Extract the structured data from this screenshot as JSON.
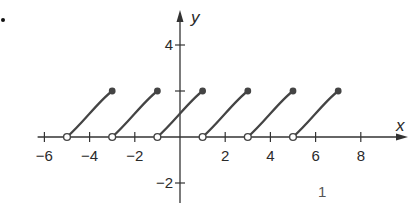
{
  "chart_data": {
    "type": "line",
    "title": "",
    "xlabel": "x",
    "ylabel": "y",
    "xlim": [
      -6.3,
      9.8
    ],
    "ylim": [
      -2.6,
      5.5
    ],
    "x_ticks": [
      -6,
      -4,
      -2,
      2,
      4,
      6,
      8
    ],
    "x_tick_labels": [
      "−6",
      "−4",
      "−2",
      "2",
      "4",
      "6",
      "8"
    ],
    "y_ticks": [
      -2,
      2,
      4
    ],
    "y_tick_labels": [
      "−2",
      "",
      "4"
    ],
    "grid": false,
    "series": [
      {
        "name": "piece-1",
        "start": {
          "x": -5,
          "y": 0,
          "closed": false
        },
        "end": {
          "x": -3,
          "y": 2,
          "closed": true
        }
      },
      {
        "name": "piece-2",
        "start": {
          "x": -3,
          "y": 0,
          "closed": false
        },
        "end": {
          "x": -1,
          "y": 2,
          "closed": true
        }
      },
      {
        "name": "piece-3",
        "start": {
          "x": -1,
          "y": 0,
          "closed": false
        },
        "end": {
          "x": 1,
          "y": 2,
          "closed": true
        }
      },
      {
        "name": "piece-4",
        "start": {
          "x": 1,
          "y": 0,
          "closed": false
        },
        "end": {
          "x": 3,
          "y": 2,
          "closed": true
        }
      },
      {
        "name": "piece-5",
        "start": {
          "x": 3,
          "y": 0,
          "closed": false
        },
        "end": {
          "x": 5,
          "y": 2,
          "closed": true
        }
      },
      {
        "name": "piece-6",
        "start": {
          "x": 5,
          "y": 0,
          "closed": false
        },
        "end": {
          "x": 7,
          "y": 2,
          "closed": true
        }
      }
    ],
    "annotations": [
      "1"
    ]
  },
  "colors": {
    "curve": "#444444",
    "axis": "#333333"
  },
  "page_marker": "1",
  "bullet": "•"
}
